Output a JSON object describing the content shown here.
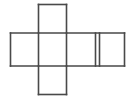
{
  "figure": {
    "name": "cube-net-cross",
    "canvas": {
      "width": 137,
      "height": 100,
      "background": "#ffffff"
    },
    "stroke": {
      "color": "#494949",
      "width": 1.6
    },
    "grid": {
      "vertical_lines_x": [
        10.5,
        38.5,
        66.5,
        95.5,
        99.5,
        124.5
      ],
      "horizontal_lines_y": [
        4.5,
        33.0,
        66.0,
        94.5
      ]
    },
    "squares": [
      {
        "id": "top-square",
        "x": 38.5,
        "y": 4.5,
        "width": 28,
        "height": 28.5
      },
      {
        "id": "middle-left-square",
        "x": 10.5,
        "y": 33.0,
        "width": 28,
        "height": 33.0
      },
      {
        "id": "middle-center-square",
        "x": 38.5,
        "y": 33.0,
        "width": 28,
        "height": 33.0
      },
      {
        "id": "middle-right-square",
        "x": 66.5,
        "y": 33.0,
        "width": 29,
        "height": 33.0
      },
      {
        "id": "far-right-square",
        "x": 99.5,
        "y": 33.0,
        "width": 25,
        "height": 33.0
      },
      {
        "id": "bottom-square",
        "x": 38.5,
        "y": 66.0,
        "width": 28,
        "height": 28.5
      }
    ],
    "segments": [
      {
        "id": "top-edge-top-square",
        "x1": 38.5,
        "y1": 4.5,
        "x2": 66.5,
        "y2": 4.5
      },
      {
        "id": "left-edge-top-square",
        "x1": 38.5,
        "y1": 4.5,
        "x2": 38.5,
        "y2": 33.0
      },
      {
        "id": "right-edge-top-square",
        "x1": 66.5,
        "y1": 4.5,
        "x2": 66.5,
        "y2": 33.0
      },
      {
        "id": "upper-horizontal-band",
        "x1": 10.5,
        "y1": 33.0,
        "x2": 124.5,
        "y2": 33.0
      },
      {
        "id": "lower-horizontal-band",
        "x1": 10.5,
        "y1": 66.0,
        "x2": 124.5,
        "y2": 66.0
      },
      {
        "id": "left-edge-middle-row",
        "x1": 10.5,
        "y1": 33.0,
        "x2": 10.5,
        "y2": 66.0
      },
      {
        "id": "divider-left-center",
        "x1": 38.5,
        "y1": 33.0,
        "x2": 38.5,
        "y2": 66.0
      },
      {
        "id": "divider-center-right",
        "x1": 66.5,
        "y1": 33.0,
        "x2": 66.5,
        "y2": 66.0
      },
      {
        "id": "divider-right-far-a",
        "x1": 95.5,
        "y1": 33.0,
        "x2": 95.5,
        "y2": 66.0
      },
      {
        "id": "divider-right-far-b",
        "x1": 99.5,
        "y1": 33.0,
        "x2": 99.5,
        "y2": 66.0
      },
      {
        "id": "right-edge-middle-row",
        "x1": 124.5,
        "y1": 33.0,
        "x2": 124.5,
        "y2": 66.0
      },
      {
        "id": "left-edge-bottom-square",
        "x1": 38.5,
        "y1": 66.0,
        "x2": 38.5,
        "y2": 94.5
      },
      {
        "id": "right-edge-bottom-square",
        "x1": 66.5,
        "y1": 66.0,
        "x2": 66.5,
        "y2": 94.5
      },
      {
        "id": "bottom-edge-bottom-square",
        "x1": 38.5,
        "y1": 94.5,
        "x2": 66.5,
        "y2": 94.5
      }
    ]
  }
}
